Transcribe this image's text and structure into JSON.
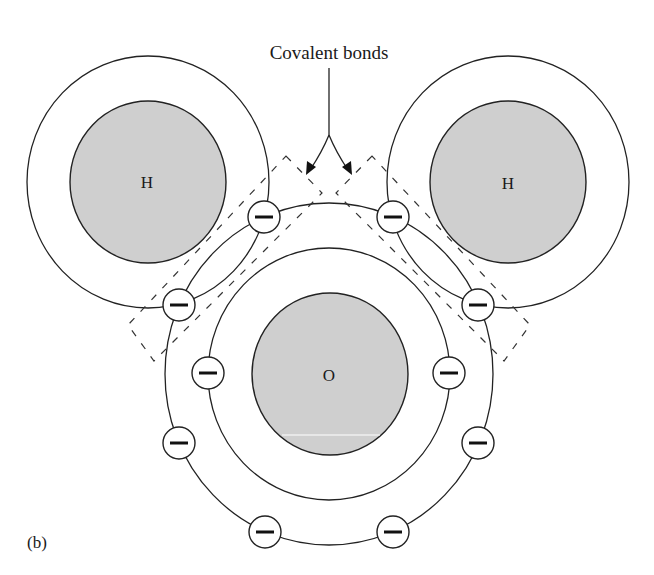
{
  "figure": {
    "label": "(b)",
    "callout": "Covalent bonds",
    "colors": {
      "nucleus_fill": "#cfcfcf",
      "line": "#222222",
      "background": "#ffffff"
    }
  },
  "atoms": [
    {
      "id": "hydrogen-left",
      "symbol": "H",
      "role": "hydrogen"
    },
    {
      "id": "hydrogen-right",
      "symbol": "H",
      "role": "hydrogen"
    },
    {
      "id": "oxygen",
      "symbol": "O",
      "role": "oxygen"
    }
  ],
  "electrons": {
    "oxygen_inner_shell_count": 2,
    "oxygen_outer_shell_count": 8,
    "shared_pairs": 2,
    "symbol": "minus-sign"
  }
}
